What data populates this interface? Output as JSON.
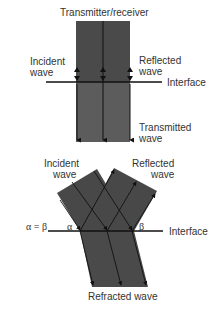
{
  "top_diagram": {
    "title": "Transmitter/receiver",
    "incident_label_1": "Incident",
    "incident_label_2": "wave",
    "reflected_label_1": "Reflected",
    "reflected_label_2": "wave",
    "interface_label": "Interface",
    "transmitted_label_1": "Transmitted",
    "transmitted_label_2": "wave"
  },
  "bottom_diagram": {
    "incident_label_1": "Incident",
    "incident_label_2": "wave",
    "reflected_label_1": "Reflected",
    "reflected_label_2": "wave",
    "equation_label": "α = β",
    "alpha_label": "α",
    "beta_label": "β",
    "interface_label": "Interface",
    "refracted_label": "Refracted wave"
  },
  "colors": {
    "beam_upper": "#4a4a4a",
    "beam_lower": "#5a5a5a",
    "line": "#111111",
    "text": "#333333"
  }
}
